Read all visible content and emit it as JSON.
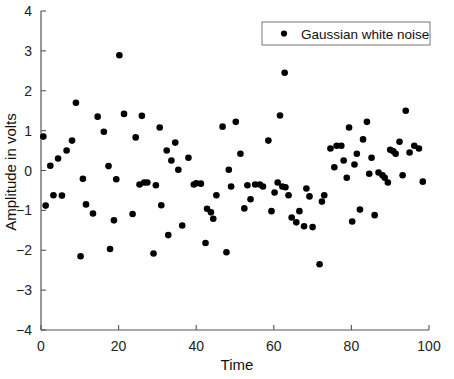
{
  "chart_data": {
    "type": "scatter",
    "title": "",
    "xlabel": "Time",
    "ylabel": "Amplitude in volts",
    "xlim": [
      0,
      100
    ],
    "ylim": [
      -4,
      4
    ],
    "xticks": [
      0,
      20,
      40,
      60,
      80,
      100
    ],
    "yticks": [
      -4,
      -3,
      -2,
      -1,
      0,
      1,
      2,
      3,
      4
    ],
    "xtick_labels": [
      "0",
      "20",
      "40",
      "60",
      "80",
      "100"
    ],
    "ytick_labels": [
      "-4",
      "-3",
      "-2",
      "-1",
      "0",
      "1",
      "2",
      "3",
      "4"
    ],
    "grid": false,
    "legend_position": "upper right",
    "series": [
      {
        "name": "Gaussian white noise",
        "marker": "circle",
        "color": "#000000",
        "points": [
          [
            0.6,
            0.85
          ],
          [
            1.2,
            -0.88
          ],
          [
            2.4,
            0.12
          ],
          [
            3.2,
            -0.62
          ],
          [
            4.4,
            0.3
          ],
          [
            5.4,
            -0.63
          ],
          [
            6.6,
            0.5
          ],
          [
            8.0,
            0.75
          ],
          [
            9.0,
            1.7
          ],
          [
            10.2,
            -2.15
          ],
          [
            10.8,
            -0.21
          ],
          [
            11.6,
            -0.85
          ],
          [
            13.4,
            -1.08
          ],
          [
            14.6,
            1.35
          ],
          [
            16.2,
            0.97
          ],
          [
            17.4,
            0.11
          ],
          [
            17.8,
            -1.97
          ],
          [
            18.8,
            -1.25
          ],
          [
            19.4,
            -0.22
          ],
          [
            20.2,
            2.89
          ],
          [
            21.4,
            1.42
          ],
          [
            23.6,
            -1.09
          ],
          [
            24.4,
            0.83
          ],
          [
            25.4,
            -0.35
          ],
          [
            26.0,
            1.37
          ],
          [
            26.6,
            -0.3
          ],
          [
            27.4,
            -0.3
          ],
          [
            29.0,
            -2.08
          ],
          [
            29.6,
            -0.37
          ],
          [
            30.6,
            1.08
          ],
          [
            31.0,
            -0.87
          ],
          [
            32.4,
            0.5
          ],
          [
            32.8,
            -1.62
          ],
          [
            33.6,
            0.25
          ],
          [
            34.6,
            0.7
          ],
          [
            35.4,
            0.02
          ],
          [
            36.4,
            -1.38
          ],
          [
            38.0,
            0.32
          ],
          [
            39.4,
            -0.35
          ],
          [
            40.0,
            -0.32
          ],
          [
            41.2,
            -0.33
          ],
          [
            42.4,
            -1.82
          ],
          [
            42.8,
            -0.96
          ],
          [
            43.8,
            -1.05
          ],
          [
            44.4,
            -1.21
          ],
          [
            45.2,
            -0.62
          ],
          [
            46.8,
            1.1
          ],
          [
            47.8,
            -2.05
          ],
          [
            48.4,
            0.02
          ],
          [
            49.0,
            -0.4
          ],
          [
            50.2,
            1.22
          ],
          [
            51.4,
            0.42
          ],
          [
            52.4,
            -0.95
          ],
          [
            53.2,
            -0.37
          ],
          [
            54.0,
            -0.72
          ],
          [
            55.2,
            -0.35
          ],
          [
            56.4,
            -0.35
          ],
          [
            57.2,
            -0.4
          ],
          [
            58.6,
            0.75
          ],
          [
            59.4,
            -1.02
          ],
          [
            60.2,
            -0.55
          ],
          [
            61.0,
            -0.3
          ],
          [
            61.6,
            1.38
          ],
          [
            62.2,
            -0.4
          ],
          [
            62.8,
            2.45
          ],
          [
            63.0,
            -0.42
          ],
          [
            63.8,
            -0.62
          ],
          [
            64.6,
            -1.18
          ],
          [
            65.8,
            -1.3
          ],
          [
            66.6,
            -1.02
          ],
          [
            67.8,
            -1.4
          ],
          [
            68.4,
            -0.45
          ],
          [
            69.2,
            -0.65
          ],
          [
            70.0,
            -1.42
          ],
          [
            71.8,
            -2.35
          ],
          [
            72.4,
            -0.78
          ],
          [
            73.0,
            -0.62
          ],
          [
            74.6,
            0.55
          ],
          [
            75.6,
            0.08
          ],
          [
            76.2,
            0.62
          ],
          [
            77.4,
            0.62
          ],
          [
            78.0,
            0.25
          ],
          [
            78.8,
            -0.18
          ],
          [
            79.4,
            1.08
          ],
          [
            80.2,
            -1.28
          ],
          [
            80.8,
            0.15
          ],
          [
            81.4,
            0.42
          ],
          [
            82.2,
            -0.98
          ],
          [
            83.0,
            0.78
          ],
          [
            84.0,
            1.22
          ],
          [
            84.6,
            -0.08
          ],
          [
            85.2,
            0.32
          ],
          [
            86.0,
            -1.12
          ],
          [
            87.0,
            -0.05
          ],
          [
            88.0,
            -0.12
          ],
          [
            88.6,
            -0.18
          ],
          [
            89.4,
            -0.3
          ],
          [
            90.0,
            0.52
          ],
          [
            90.8,
            0.48
          ],
          [
            91.4,
            0.42
          ],
          [
            92.4,
            0.72
          ],
          [
            93.2,
            -0.12
          ],
          [
            94.0,
            1.5
          ],
          [
            95.0,
            0.45
          ],
          [
            96.2,
            0.62
          ],
          [
            97.4,
            0.55
          ],
          [
            98.4,
            -0.28
          ]
        ]
      }
    ]
  },
  "legend": {
    "label": "Gaussian white noise"
  },
  "axes": {
    "x_title": "Time",
    "y_title": "Amplitude in volts"
  }
}
